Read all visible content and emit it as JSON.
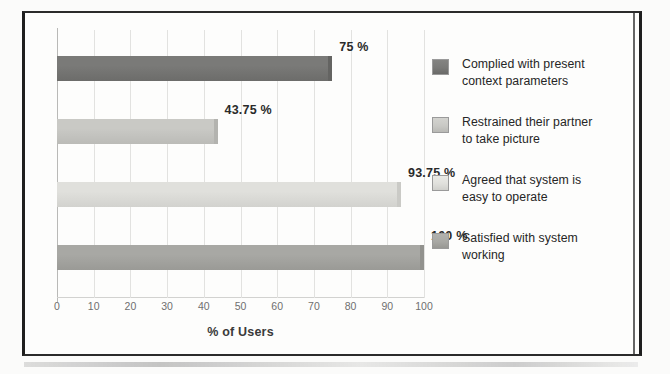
{
  "figure": {
    "x_axis_title": "% of Users"
  },
  "chart_data": {
    "type": "bar",
    "orientation": "horizontal",
    "title": "",
    "xlabel": "% of Users",
    "ylabel": "",
    "xlim": [
      0,
      100
    ],
    "xticks": [
      0,
      10,
      20,
      30,
      40,
      50,
      60,
      70,
      80,
      90,
      100
    ],
    "xtick_labels": [
      "0",
      "10",
      "20",
      "30",
      "40",
      "50",
      "60",
      "70",
      "80",
      "90",
      "100"
    ],
    "grid": true,
    "grid_axis": "x",
    "legend_position": "right",
    "categories": [
      "Complied with present context parameters",
      "Restrained their partner to take picture",
      "Agreed that system is easy to operate",
      "Satisfied with system working"
    ],
    "values": [
      75,
      43.75,
      93.75,
      100
    ],
    "data_labels": [
      "75 %",
      "43.75 %",
      "93.75 %",
      "100 %"
    ],
    "colors": [
      "#7a7a78",
      "#c9c9c5",
      "#e0e0dc",
      "#a8a8a4"
    ],
    "bars": [
      {
        "label": "Complied with present context parameters",
        "value": 75,
        "data_label": "75 %",
        "color": "#7a7a78"
      },
      {
        "label": "Restrained their partner to take picture",
        "value": 43.75,
        "data_label": "43.75 %",
        "color": "#c9c9c5"
      },
      {
        "label": "Agreed that system is easy to operate",
        "value": 93.75,
        "data_label": "93.75 %",
        "color": "#e0e0dc"
      },
      {
        "label": "Satisfied with system working",
        "value": 100,
        "data_label": "100 %",
        "color": "#a8a8a4"
      }
    ],
    "legend": [
      {
        "line1": "Complied with present",
        "line2": "context parameters",
        "color": "#7a7a78"
      },
      {
        "line1": "Restrained their partner",
        "line2": "to take picture",
        "color": "#c9c9c5"
      },
      {
        "line1": "Agreed that system is",
        "line2": "easy to operate",
        "color": "#e0e0dc"
      },
      {
        "line1": "Satisfied with system",
        "line2": "working",
        "color": "#a8a8a4"
      }
    ]
  }
}
